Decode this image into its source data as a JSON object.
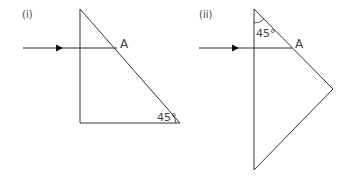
{
  "diagrams": [
    {
      "label": "(i)",
      "point_label": "A",
      "angle_label": "45°",
      "angle_location": "bottom-right vertex",
      "shape": "right triangle prism",
      "ray": "horizontal incident ray from left hitting hypotenuse at A"
    },
    {
      "label": "(ii)",
      "point_label": "A",
      "angle_label": "45°",
      "angle_location": "top vertex",
      "shape": "right isosceles triangle prism (hypotenuse vertical)",
      "ray": "horizontal incident ray from left hitting face at A"
    }
  ],
  "colors": {
    "line": "#333333",
    "text": "#444444",
    "background": "#ffffff"
  }
}
